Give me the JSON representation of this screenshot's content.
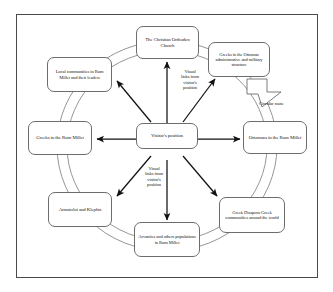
{
  "figure": {
    "type": "circular-relationship-diagram",
    "background_color": "#ffffff",
    "frame_color": "#4a4a4a",
    "node_border_color": "#6d6d6d",
    "arrow_color": "#111111",
    "ring_color": "#8a8a8a"
  },
  "center": {
    "id": "visitors-position",
    "label": "Visitor's position"
  },
  "nodes": [
    {
      "id": "christian-orthodox-church",
      "label": "The Christian Orthodox Church"
    },
    {
      "id": "greeks-ottoman-structure",
      "label": "Greeks in the Ottoman administrative and military structure"
    },
    {
      "id": "ottomans-rum-millet",
      "label": "Ottomans in the Rum Millet"
    },
    {
      "id": "greek-diaspora",
      "label": "Greek Diaspora Greek communities around the world"
    },
    {
      "id": "arvanites-others",
      "label": "Arvanites and others populations  in Rum Millet"
    },
    {
      "id": "armatoloi-klephts",
      "label": "Armatoloi and Klephts"
    },
    {
      "id": "greeks-rum-millet",
      "label": "Greeks in the Rum Millet"
    },
    {
      "id": "local-communities",
      "label": "Local communities in Rum Millet and their leaders"
    }
  ],
  "annotations": {
    "visual_links_top": "Visual\nlinks from\nvisitor's\nposition",
    "visual_links_bottom": "Visual\nlinks from\nvisitor's\nposition",
    "circular_route": "Circular route"
  },
  "icons": {
    "circular_route_arrow": "block-arrow-icon"
  }
}
